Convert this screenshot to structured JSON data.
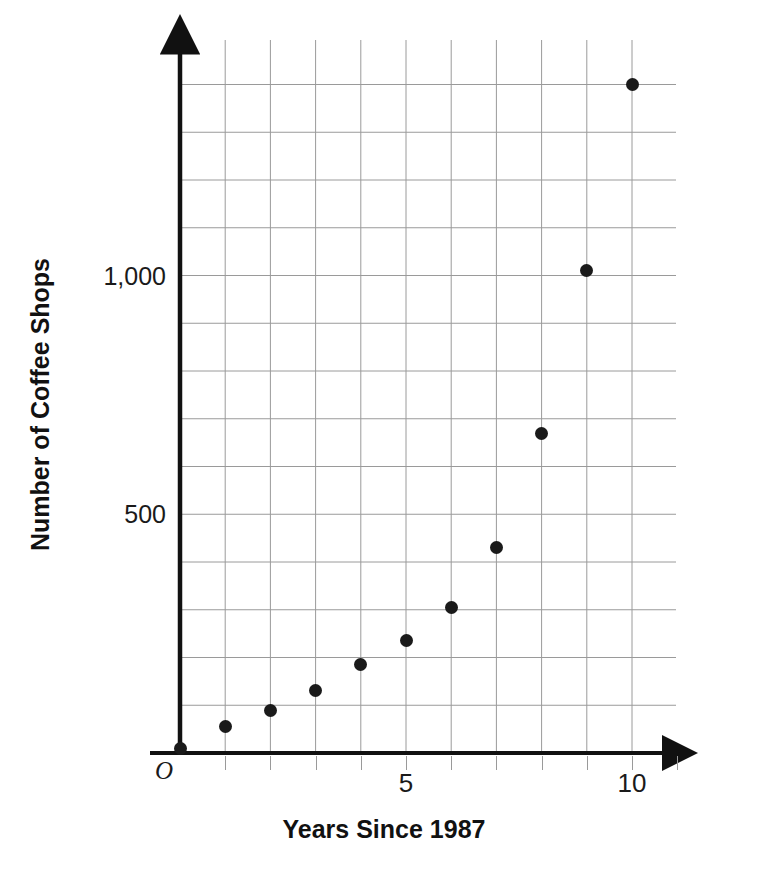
{
  "chart_data": {
    "type": "scatter",
    "title": "",
    "xlabel": "Years Since 1987",
    "ylabel": "Number of Coffee Shops",
    "xlim": [
      0,
      11
    ],
    "ylim": [
      0,
      1500
    ],
    "grid": true,
    "legend": "none",
    "x_tick_labels": [
      "5",
      "10"
    ],
    "x_tick_values": [
      5,
      10
    ],
    "x_gridline_step": 1,
    "y_tick_labels": [
      "500",
      "1,000"
    ],
    "y_tick_values": [
      500,
      1000
    ],
    "y_gridline_step": 100,
    "origin_label": "O",
    "point_color": "#1a1a1a",
    "grid_color": "#9a9a9a",
    "axis_color": "#111111",
    "background_color": "#ffffff",
    "x": [
      0,
      1,
      2,
      3,
      4,
      5,
      6,
      7,
      8,
      9,
      10
    ],
    "values": [
      10,
      55,
      90,
      130,
      185,
      235,
      305,
      430,
      670,
      1010,
      1400
    ],
    "points": [
      {
        "x": 0,
        "y": 10
      },
      {
        "x": 1,
        "y": 55
      },
      {
        "x": 2,
        "y": 90
      },
      {
        "x": 3,
        "y": 130
      },
      {
        "x": 4,
        "y": 185
      },
      {
        "x": 5,
        "y": 235
      },
      {
        "x": 6,
        "y": 305
      },
      {
        "x": 7,
        "y": 430
      },
      {
        "x": 8,
        "y": 670
      },
      {
        "x": 9,
        "y": 1010
      },
      {
        "x": 10,
        "y": 1400
      }
    ]
  }
}
